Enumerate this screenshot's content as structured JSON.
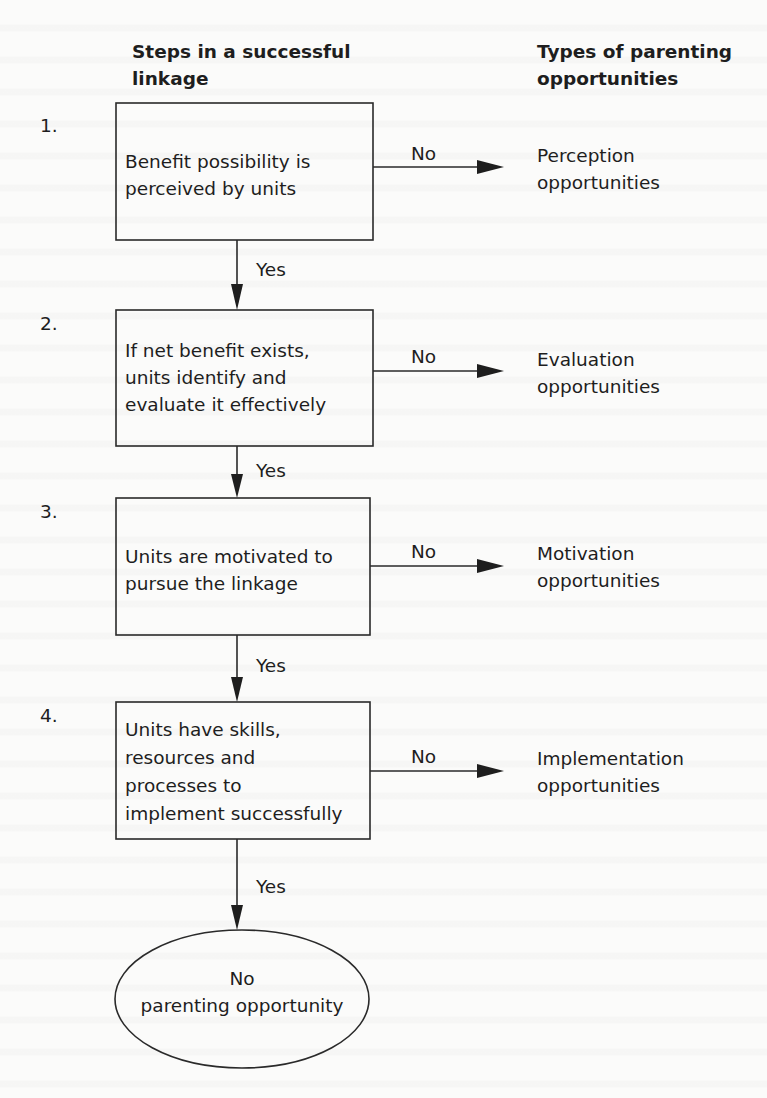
{
  "headers": {
    "left": [
      "Steps in a successful",
      "linkage"
    ],
    "right": [
      "Types of parenting",
      "opportunities"
    ]
  },
  "steps": [
    {
      "number": "1.",
      "text": [
        "Benefit possibility is",
        "perceived by units"
      ],
      "no_label": "No",
      "yes_label": "Yes",
      "outcome": [
        "Perception",
        "opportunities"
      ]
    },
    {
      "number": "2.",
      "text": [
        "If net benefit exists,",
        "units identify and",
        "evaluate it effectively"
      ],
      "no_label": "No",
      "yes_label": "Yes",
      "outcome": [
        "Evaluation",
        "opportunities"
      ]
    },
    {
      "number": "3.",
      "text": [
        "Units are motivated to",
        "pursue the linkage"
      ],
      "no_label": "No",
      "yes_label": "Yes",
      "outcome": [
        "Motivation",
        "opportunities"
      ]
    },
    {
      "number": "4.",
      "text": [
        "Units have skills,",
        "resources and",
        "processes to",
        "implement successfully"
      ],
      "no_label": "No",
      "yes_label": "Yes",
      "outcome": [
        "Implementation",
        "opportunities"
      ]
    }
  ],
  "terminal": {
    "text": [
      "No",
      "parenting opportunity"
    ]
  },
  "colors": {
    "background": "#fbfbfa",
    "ink": "#1e1e1e"
  }
}
